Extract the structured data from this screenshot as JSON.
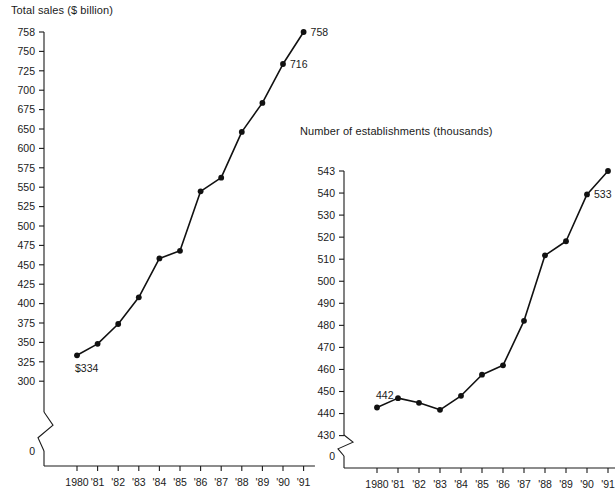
{
  "chart_data": [
    {
      "id": "total-sales",
      "type": "line",
      "title": "Total sales ($ billion)",
      "xlabel": "",
      "ylabel": "",
      "grid": false,
      "legend": "none",
      "axis_break": true,
      "categories": [
        "1980",
        "'81",
        "'82",
        "'83",
        "'84",
        "'85",
        "'86",
        "'87",
        "'88",
        "'89",
        "'90",
        "'91"
      ],
      "values": [
        334,
        349,
        375,
        410,
        461,
        471,
        549,
        567,
        627,
        665,
        716,
        758
      ],
      "ylim": [
        300,
        758
      ],
      "ytick_labels": [
        "758",
        "750",
        "725",
        "700",
        "675",
        "650",
        "600",
        "575",
        "550",
        "525",
        "500",
        "475",
        "450",
        "425",
        "400",
        "375",
        "350",
        "325",
        "300",
        "0"
      ],
      "ytick_values": [
        758,
        750,
        725,
        700,
        675,
        650,
        625,
        575,
        550,
        525,
        500,
        475,
        450,
        425,
        400,
        375,
        350,
        325,
        300,
        0
      ],
      "annotations": [
        {
          "text": "$334",
          "point_index": 0,
          "position": "below-left"
        },
        {
          "text": "716",
          "point_index": 10,
          "position": "right"
        },
        {
          "text": "758",
          "point_index": 11,
          "position": "right"
        }
      ]
    },
    {
      "id": "number-of-establishments",
      "type": "line",
      "title": "Number of establishments (thousands)",
      "xlabel": "",
      "ylabel": "",
      "grid": false,
      "legend": "none",
      "axis_break": true,
      "categories": [
        "1980",
        "'81",
        "'82",
        "'83",
        "'84",
        "'85",
        "'86",
        "'87",
        "'88",
        "'89",
        "'90",
        "'91"
      ],
      "values": [
        442,
        446,
        444,
        441,
        447,
        456,
        460,
        479,
        507,
        513,
        533,
        543
      ],
      "ylim": [
        430,
        543
      ],
      "ytick_labels": [
        "543",
        "540",
        "530",
        "520",
        "510",
        "500",
        "490",
        "480",
        "470",
        "460",
        "450",
        "440",
        "430",
        "0"
      ],
      "ytick_values": [
        543,
        540,
        530,
        520,
        510,
        500,
        490,
        480,
        470,
        460,
        450,
        440,
        430,
        0
      ],
      "annotations": [
        {
          "text": "442",
          "point_index": 0,
          "position": "above"
        },
        {
          "text": "533",
          "point_index": 10,
          "position": "right"
        },
        {
          "text": "543",
          "point_index": 11,
          "position": "right"
        }
      ]
    }
  ],
  "colors": {
    "line": "#111111",
    "marker": "#111111",
    "axis": "#1a1a1a",
    "text": "#1a1a1a",
    "background": "#ffffff"
  }
}
